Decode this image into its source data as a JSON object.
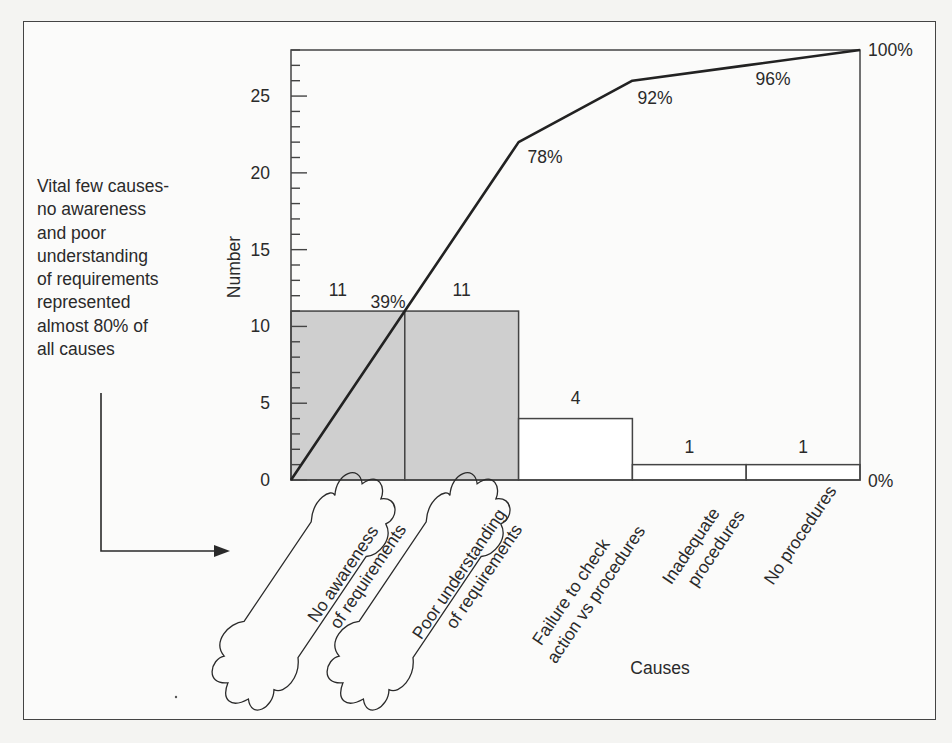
{
  "chart_data": {
    "type": "pareto",
    "title": "",
    "xlabel": "Causes",
    "ylabel": "Number",
    "ylim": [
      0,
      28
    ],
    "yticks": [
      0,
      5,
      10,
      15,
      20,
      25
    ],
    "grid": false,
    "categories": [
      "No awareness of requirements",
      "Poor understanding of requirements",
      "Failure to check action vs procedures",
      "Inadequate procedures",
      "No procedures"
    ],
    "category_lines": [
      [
        "No awareness",
        "of requirements"
      ],
      [
        "Poor understanding",
        "of requirements"
      ],
      [
        "Failure to check",
        "action vs procedures"
      ],
      [
        "Inadequate",
        "procedures"
      ],
      [
        "No procedures"
      ]
    ],
    "series": [
      {
        "name": "Number",
        "type": "bar",
        "values": [
          11,
          11,
          4,
          1,
          1
        ],
        "highlighted": [
          true,
          true,
          false,
          false,
          false
        ]
      },
      {
        "name": "Cumulative %",
        "type": "line",
        "values": [
          39,
          78,
          92,
          96,
          100
        ]
      }
    ],
    "value_labels": [
      "11",
      "11",
      "4",
      "1",
      "1"
    ],
    "cumulative_labels": [
      "39%",
      "78%",
      "92%",
      "96%",
      "100%"
    ],
    "right_axis_labels": {
      "top": "100%",
      "bottom": "0%"
    },
    "annotation": {
      "lines": [
        "Vital few causes-",
        "no awareness",
        "and poor",
        "understanding",
        "of requirements",
        "represented",
        "almost 80% of",
        "all causes"
      ]
    }
  },
  "colors": {
    "highlight_bar": "#cfcfcf",
    "plain_bar": "#ffffff",
    "line": "#222222",
    "frame": "#444444"
  }
}
